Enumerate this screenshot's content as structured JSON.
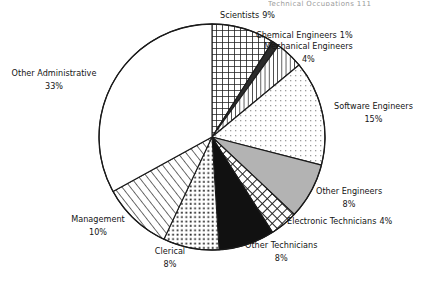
{
  "page": {
    "header_fragment": "Technical Occupations   111",
    "background": "#ffffff",
    "text_color": "#141414"
  },
  "chart_data": {
    "type": "pie",
    "title": "",
    "total_label": "100%",
    "start_angle_deg": 0,
    "direction": "clockwise",
    "legend": "inline-labels",
    "categories": [
      "Scientists",
      "Chemical Engineers",
      "Mechanical Engineers",
      "Software Engineers",
      "Other Engineers",
      "Electronic Technicians",
      "Other Technicians",
      "Clerical",
      "Management",
      "Other Administrative"
    ],
    "values": [
      9,
      1,
      4,
      15,
      8,
      4,
      8,
      8,
      10,
      33
    ],
    "value_labels": [
      "9%",
      "1%",
      "4%",
      "15%",
      "8%",
      "4%",
      "8%",
      "8%",
      "10%",
      "33%"
    ],
    "slices": [
      {
        "label": "Scientists",
        "value": 9,
        "value_label": "9%",
        "pattern": "square-grid-dark",
        "fill": "#ffffff",
        "stroke": "#1a1a1a"
      },
      {
        "label": "Chemical Engineers",
        "value": 1,
        "value_label": "1%",
        "pattern": "solid-dark",
        "fill": "#2b2b2b",
        "stroke": "#1a1a1a"
      },
      {
        "label": "Mechanical Engineers",
        "value": 4,
        "value_label": "4%",
        "pattern": "vertical-lines",
        "fill": "#ffffff",
        "stroke": "#1a1a1a"
      },
      {
        "label": "Software Engineers",
        "value": 15,
        "value_label": "15%",
        "pattern": "light-dot-grid",
        "fill": "#ffffff",
        "stroke": "#1a1a1a"
      },
      {
        "label": "Other Engineers",
        "value": 8,
        "value_label": "8%",
        "pattern": "solid-gray",
        "fill": "#b3b3b3",
        "stroke": "#1a1a1a"
      },
      {
        "label": "Electronic Technicians",
        "value": 4,
        "value_label": "4%",
        "pattern": "diagonal-crosshatch",
        "fill": "#ffffff",
        "stroke": "#1a1a1a"
      },
      {
        "label": "Other Technicians",
        "value": 8,
        "value_label": "8%",
        "pattern": "solid-black",
        "fill": "#111111",
        "stroke": "#1a1a1a"
      },
      {
        "label": "Clerical",
        "value": 8,
        "value_label": "8%",
        "pattern": "stipple-dots",
        "fill": "#ffffff",
        "stroke": "#1a1a1a"
      },
      {
        "label": "Management",
        "value": 10,
        "value_label": "10%",
        "pattern": "diagonal-lines",
        "fill": "#ffffff",
        "stroke": "#1a1a1a"
      },
      {
        "label": "Other Administrative",
        "value": 33,
        "value_label": "33%",
        "pattern": "blank-white",
        "fill": "#ffffff",
        "stroke": "#1a1a1a"
      }
    ],
    "geometry": {
      "center_x": 212,
      "center_y": 137,
      "radius": 113
    }
  },
  "labels": {
    "scientists": {
      "name": "Scientists",
      "pct": "9%"
    },
    "chemical_engineers": {
      "name": "Chemical Engineers",
      "pct": "1%"
    },
    "mechanical_engineers": {
      "name": "Mechanical Engineers",
      "pct": "4%"
    },
    "software_engineers": {
      "name": "Software Engineers",
      "pct": "15%"
    },
    "other_engineers": {
      "name": "Other Engineers",
      "pct": "8%"
    },
    "electronic_technicians": {
      "name": "Electronic Technicians",
      "pct": "4%"
    },
    "other_technicians": {
      "name": "Other Technicians",
      "pct": "8%"
    },
    "clerical": {
      "name": "Clerical",
      "pct": "8%"
    },
    "management": {
      "name": "Management",
      "pct": "10%"
    },
    "other_administrative": {
      "name": "Other Administrative",
      "pct": "33%"
    }
  }
}
